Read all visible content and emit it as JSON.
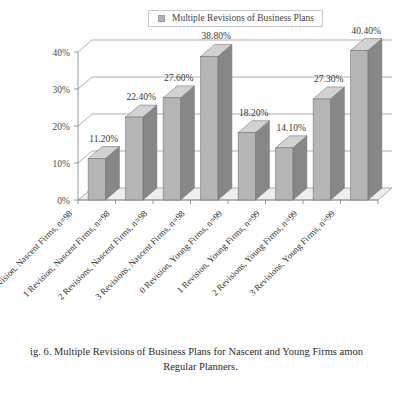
{
  "legend": {
    "swatch_name": "legend-color-swatch",
    "swatch_color": "#b2b2b2",
    "label": "Multiple Revisions of Business Plans"
  },
  "caption": {
    "line1": "ig. 6.    Multiple Revisions of Business Plans for Nascent and Young Firms amon",
    "line2": "Regular Planners."
  },
  "chart_data": {
    "type": "bar",
    "title": "Multiple Revisions of Business Plans",
    "xlabel": "",
    "ylabel": "",
    "ylim": [
      0,
      40
    ],
    "grid": true,
    "legend_position": "top-center",
    "style": "3d-column",
    "bar_face_color": "#b5b5b5",
    "bar_side_color": "#878787",
    "bar_top_color": "#d2d2d2",
    "floor_color": "#eeeeee",
    "axis_color": "#8d8d8d",
    "ytick_labels": [
      "40%",
      "30%",
      "20%",
      "10%",
      "0%"
    ],
    "ytick_values": [
      40,
      30,
      20,
      10,
      0
    ],
    "categories": [
      "0 Revision, Nascent Firms, n=98",
      "1 Revision, Nascent Firms, n=98",
      "2 Revisions, Nascent Firms, n=98",
      "3 Revisions, Nascent Firms, n=98",
      "0 Revision, Young Firms, n=99",
      "1 Revision, Young Firms, n=99",
      "2 Revisions, Young Firms, n=99",
      "3 Revisions, Young Firms, n=99"
    ],
    "values": [
      11.2,
      22.4,
      27.6,
      38.8,
      18.2,
      14.1,
      27.3,
      40.4
    ],
    "data_labels": [
      "11.20%",
      "22.40%",
      "27.60%",
      "38.80%",
      "18.20%",
      "14.10%",
      "27.30%",
      "40.40%"
    ],
    "series": [
      {
        "name": "Multiple Revisions of Business Plans",
        "values": [
          11.2,
          22.4,
          27.6,
          38.8,
          18.2,
          14.1,
          27.3,
          40.4
        ]
      }
    ]
  }
}
